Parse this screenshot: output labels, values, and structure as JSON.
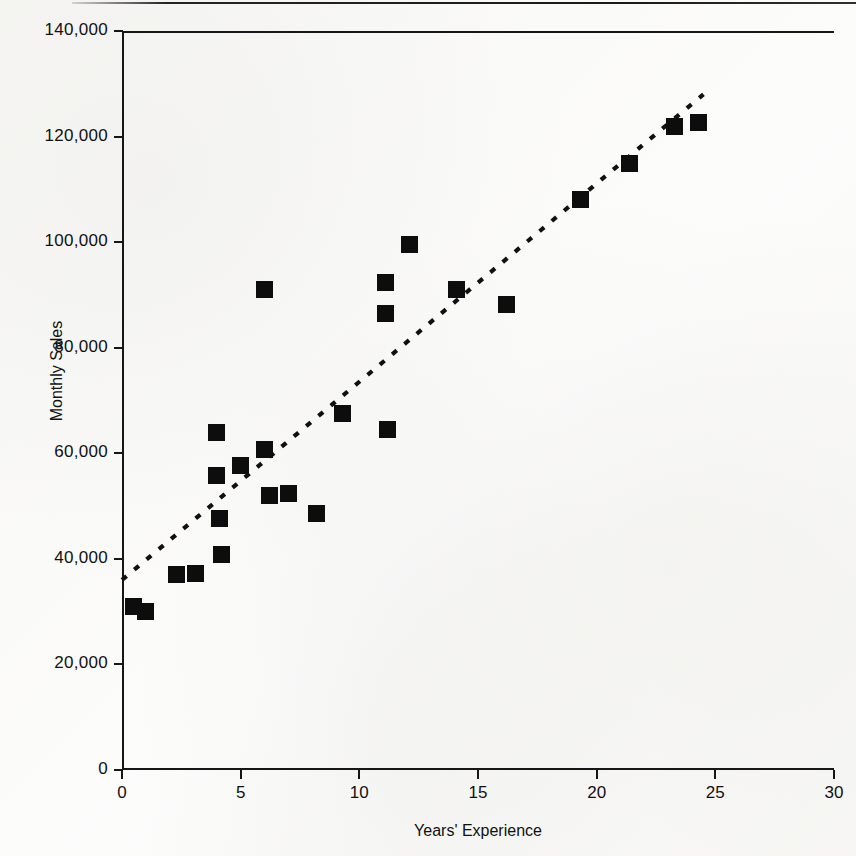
{
  "figure": {
    "axis_color": "#161616",
    "marker_color": "#0d0d0d",
    "trendline_color": "#101010"
  },
  "chart_data": {
    "type": "scatter",
    "title": "",
    "xlabel": "Years' Experience",
    "ylabel": "Monthly Sales",
    "xlim": [
      0,
      30
    ],
    "ylim": [
      0,
      140000
    ],
    "xticks": [
      0,
      5,
      10,
      15,
      20,
      25,
      30
    ],
    "xtick_labels": [
      "0",
      "5",
      "10",
      "15",
      "20",
      "25",
      "30"
    ],
    "yticks": [
      0,
      20000,
      40000,
      60000,
      80000,
      100000,
      120000,
      140000
    ],
    "ytick_labels": [
      "0",
      "20,000",
      "40,000",
      "60,000",
      "80,000",
      "100,000",
      "120,000",
      "140,000"
    ],
    "grid": false,
    "legend": null,
    "marker": "filled-square",
    "points": [
      {
        "x": 0.5,
        "y": 30900
      },
      {
        "x": 1.0,
        "y": 30000
      },
      {
        "x": 2.3,
        "y": 37000
      },
      {
        "x": 3.1,
        "y": 37200
      },
      {
        "x": 4.0,
        "y": 63900
      },
      {
        "x": 4.0,
        "y": 55700
      },
      {
        "x": 4.1,
        "y": 47600
      },
      {
        "x": 4.2,
        "y": 40800
      },
      {
        "x": 5.0,
        "y": 57700
      },
      {
        "x": 6.0,
        "y": 91000
      },
      {
        "x": 6.0,
        "y": 60800
      },
      {
        "x": 6.2,
        "y": 52000
      },
      {
        "x": 7.0,
        "y": 52400
      },
      {
        "x": 8.2,
        "y": 48600
      },
      {
        "x": 9.3,
        "y": 67500
      },
      {
        "x": 11.1,
        "y": 92400
      },
      {
        "x": 11.1,
        "y": 86400
      },
      {
        "x": 11.2,
        "y": 64500
      },
      {
        "x": 12.1,
        "y": 99500
      },
      {
        "x": 14.1,
        "y": 91000
      },
      {
        "x": 16.2,
        "y": 88200
      },
      {
        "x": 19.3,
        "y": 108000
      },
      {
        "x": 21.4,
        "y": 114900
      },
      {
        "x": 23.3,
        "y": 121900
      },
      {
        "x": 24.3,
        "y": 122700
      }
    ],
    "trendline": {
      "style": "dotted",
      "x_start": 0.0,
      "y_start": 36000,
      "x_end": 24.5,
      "y_end": 128000
    }
  }
}
